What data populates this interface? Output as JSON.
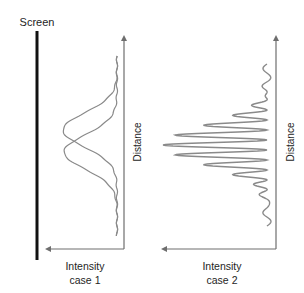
{
  "labels": {
    "screen": "Screen",
    "case1": {
      "line1": "Intensity",
      "line2": "case 1",
      "axis_y": "Distance"
    },
    "case2": {
      "line1": "Intensity",
      "line2": "case 2",
      "axis_y": "Distance"
    }
  },
  "colors": {
    "screen": "#111111",
    "axis": "#6e6e6e",
    "curve": "#8a8a8a",
    "text": "#1e1e1e"
  },
  "geometry": {
    "screen_line": {
      "x": 37,
      "y1": 31,
      "y2": 260
    },
    "case1": {
      "axis_x": 124,
      "axis_top": 34,
      "axis_bottom": 249,
      "axis_left": 44,
      "baseline_x": 117,
      "y_start": 56,
      "y_end": 236,
      "gaussians": [
        {
          "center": 130,
          "amplitude": 54,
          "sigma": 17
        },
        {
          "center": 152,
          "amplitude": 53,
          "sigma": 17
        }
      ]
    },
    "case2": {
      "axis_x": 276,
      "axis_top": 34,
      "axis_bottom": 249,
      "axis_left": 160,
      "baseline_x": 270,
      "y_start": 64,
      "y_end": 226,
      "center": 145,
      "spacing": 10,
      "envelope_amplitude": 104,
      "envelope_sigma": 20,
      "wiggle": 4
    }
  }
}
